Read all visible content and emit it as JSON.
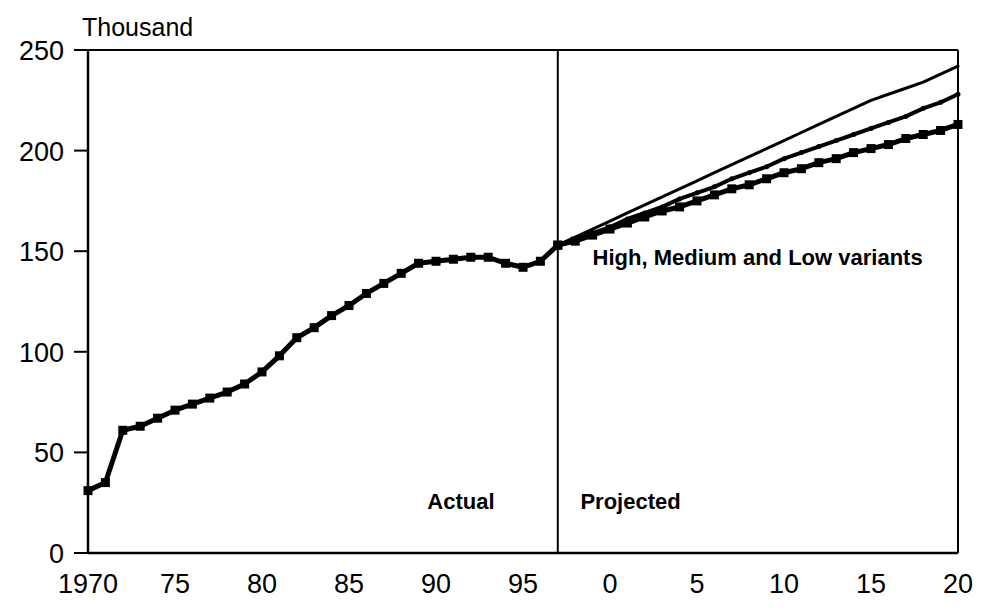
{
  "chart_data": {
    "type": "line",
    "title": "",
    "subtitle": "",
    "xlabel": "",
    "ylabel": "Thousand",
    "units_label": "Thousand",
    "grid": false,
    "legend_position": "none",
    "xlim": [
      1970,
      2020
    ],
    "ylim": [
      0,
      250
    ],
    "ytick_labels": [
      "250",
      "200",
      "150",
      "100",
      "50",
      "0"
    ],
    "ytick_values": [
      250,
      200,
      150,
      100,
      50,
      0
    ],
    "xtick_labels": [
      "1970",
      "75",
      "80",
      "85",
      "90",
      "95",
      "0",
      "5",
      "10",
      "15",
      "20"
    ],
    "xtick_values": [
      1970,
      1975,
      1980,
      1985,
      1990,
      1995,
      2000,
      2005,
      2010,
      2015,
      2020
    ],
    "divider_x": 1997,
    "annotations": [
      {
        "name": "variants-label",
        "text": "High, Medium and Low variants",
        "x": 1999,
        "y": 143
      },
      {
        "name": "actual-label",
        "text": "Actual",
        "x": 1989.5,
        "y": 22
      },
      {
        "name": "projected-label",
        "text": "Projected",
        "x": 1998.3,
        "y": 22
      }
    ],
    "series": [
      {
        "name": "Actual",
        "marker": "square",
        "marker_size": 9,
        "line_width": 5,
        "color": "#000000",
        "x": [
          1970,
          1971,
          1972,
          1973,
          1974,
          1975,
          1976,
          1977,
          1978,
          1979,
          1980,
          1981,
          1982,
          1983,
          1984,
          1985,
          1986,
          1987,
          1988,
          1989,
          1990,
          1991,
          1992,
          1993,
          1994,
          1995,
          1996,
          1997
        ],
        "values": [
          31,
          35,
          61,
          63,
          67,
          71,
          74,
          77,
          80,
          84,
          90,
          98,
          107,
          112,
          118,
          123,
          129,
          134,
          139,
          144,
          145,
          146,
          147,
          147,
          144,
          142,
          145,
          153
        ]
      },
      {
        "name": "High",
        "marker": "none",
        "marker_size": 0,
        "line_width": 3,
        "color": "#000000",
        "x": [
          1997,
          1998,
          1999,
          2000,
          2001,
          2002,
          2003,
          2004,
          2005,
          2006,
          2007,
          2008,
          2009,
          2010,
          2011,
          2012,
          2013,
          2014,
          2015,
          2016,
          2017,
          2018,
          2019,
          2020
        ],
        "values": [
          153,
          157,
          161,
          165,
          169,
          173,
          177,
          181,
          185,
          189,
          193,
          197,
          201,
          205,
          209,
          213,
          217,
          221,
          225,
          228,
          231,
          234,
          238,
          242
        ]
      },
      {
        "name": "Medium",
        "marker": "dot",
        "marker_size": 5,
        "line_width": 4,
        "color": "#000000",
        "x": [
          1997,
          1998,
          1999,
          2000,
          2001,
          2002,
          2003,
          2004,
          2005,
          2006,
          2007,
          2008,
          2009,
          2010,
          2011,
          2012,
          2013,
          2014,
          2015,
          2016,
          2017,
          2018,
          2019,
          2020
        ],
        "values": [
          153,
          156,
          159,
          162,
          166,
          169,
          172,
          176,
          179,
          182,
          186,
          189,
          192,
          196,
          199,
          202,
          205,
          208,
          211,
          214,
          217,
          221,
          224,
          228
        ]
      },
      {
        "name": "Low",
        "marker": "square",
        "marker_size": 9,
        "line_width": 5,
        "color": "#000000",
        "x": [
          1997,
          1998,
          1999,
          2000,
          2001,
          2002,
          2003,
          2004,
          2005,
          2006,
          2007,
          2008,
          2009,
          2010,
          2011,
          2012,
          2013,
          2014,
          2015,
          2016,
          2017,
          2018,
          2019,
          2020
        ],
        "values": [
          153,
          155,
          158,
          161,
          164,
          167,
          170,
          172,
          175,
          178,
          181,
          183,
          186,
          189,
          191,
          194,
          196,
          199,
          201,
          203,
          206,
          208,
          210,
          213
        ]
      }
    ]
  }
}
